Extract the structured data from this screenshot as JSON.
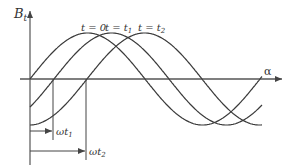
{
  "diagram": {
    "y_axis_label": "B",
    "y_axis_subscript": "t",
    "x_axis_label": "α",
    "curve_labels": [
      {
        "main": "t = 0",
        "sub": ""
      },
      {
        "main": "t = t",
        "sub": "1"
      },
      {
        "main": "t = t",
        "sub": "2"
      }
    ],
    "shift_labels": [
      {
        "main": "ωt",
        "sub": "1"
      },
      {
        "main": "ωt",
        "sub": "2"
      }
    ],
    "curves": [
      {
        "name": "t=0",
        "phase_offset_px": 0
      },
      {
        "name": "t=t1",
        "phase_offset_px": 24
      },
      {
        "name": "t=t2",
        "phase_offset_px": 57
      }
    ],
    "colors": {
      "line": "#3a3a3a",
      "axis": "#555555",
      "text": "#333333"
    }
  }
}
